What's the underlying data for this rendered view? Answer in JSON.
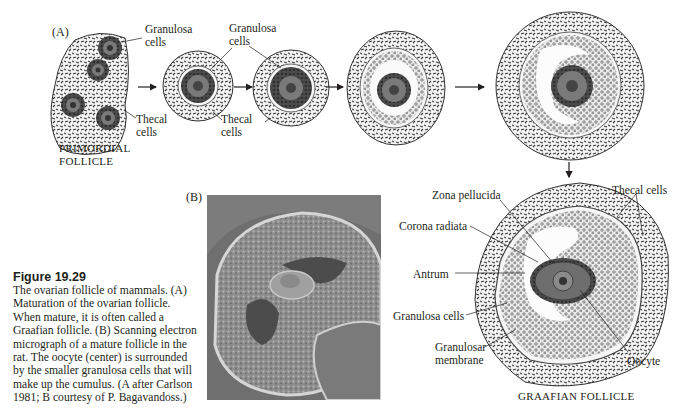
{
  "panel_a": {
    "label": "(A)",
    "primordial": {
      "granulosa_label_1": "Granulosa",
      "granulosa_label_2": "cells",
      "thecal_label_1": "Thecal",
      "thecal_label_2": "cells",
      "title_1": "PRIMORDIAL",
      "title_2": "FOLLICLE"
    },
    "stage2": {
      "thecal_label_1": "Thecal",
      "thecal_label_2": "cells"
    },
    "stage3": {
      "granulosa_label_1": "Granulosa",
      "granulosa_label_2": "cells"
    }
  },
  "panel_b": {
    "label": "(B)",
    "image_type": "scanning-electron-micrograph"
  },
  "graafian": {
    "title": "GRAAFIAN FOLLICLE",
    "labels": {
      "zona_pellucida": "Zona pellucida",
      "thecal_cells": "Thecal cells",
      "corona_radiata": "Corona radiata",
      "antrum": "Antrum",
      "granulosa_cells": "Granulosa cells",
      "granulosar_membrane_1": "Granulosar",
      "granulosar_membrane_2": "membrane",
      "oocyte": "Oocyte"
    }
  },
  "caption": {
    "title": "Figure 19.29",
    "body": "The ovarian follicle of mammals. (A) Maturation of the ovarian follicle. When mature, it is often called a Graafian follicle. (B) Scanning electron micrograph of a mature follicle in the rat. The oocyte (center) is surrounded by the smaller granulosa cells that will make up the cumulus. (A after Carlson 1981; B courtesy of P. Bagavandoss.)"
  }
}
